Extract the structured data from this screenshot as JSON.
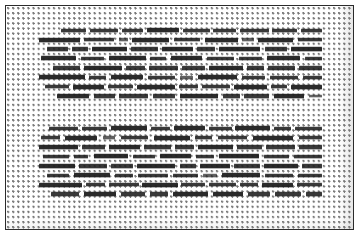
{
  "document": {
    "kind": "scanned-text-page",
    "legible": false,
    "description": "Low-resolution scan of a printed page; body text is unreadable at this resolution and renders as rows of dark dashes over a dot-screen halftone background.",
    "page_background_color": "#ffffff",
    "border_color": "#2b2b2b",
    "dot_grid_color": "#5a5a5a",
    "text_color": "#1e1e1e",
    "dot_pitch_px": 5.1,
    "line_height_px": 9.4,
    "frame": {
      "x": 5,
      "y": 5,
      "width": 349,
      "height": 225
    },
    "text_margin": {
      "left": 33,
      "right": 43,
      "top": 22,
      "bottom": 30
    }
  },
  "paragraphs": [
    {
      "name": "paragraph-1",
      "top": 20,
      "line_count": 8,
      "lines": [
        {
          "indent": 22,
          "words": [
            26,
            4,
            30,
            4,
            22,
            4,
            34,
            4,
            28,
            4,
            24,
            4,
            30,
            4,
            26,
            4,
            22
          ]
        },
        {
          "indent": 0,
          "words": [
            44,
            5,
            32,
            5,
            10,
            5,
            40,
            5,
            28,
            5,
            36,
            5,
            12,
            5,
            38,
            5,
            26
          ]
        },
        {
          "indent": 8,
          "words": [
            20,
            4,
            16,
            4,
            34,
            4,
            26,
            4,
            30,
            4,
            18,
            4,
            40,
            4,
            22,
            4,
            30
          ]
        },
        {
          "indent": 2,
          "words": [
            36,
            5,
            24,
            5,
            38,
            5,
            16,
            5,
            32,
            5,
            28,
            5,
            24,
            5,
            34,
            5,
            18
          ]
        },
        {
          "indent": 14,
          "words": [
            28,
            4,
            40,
            4,
            20,
            4,
            30,
            4,
            24,
            4,
            36,
            4,
            18,
            4,
            28,
            4,
            24
          ]
        },
        {
          "indent": 0,
          "words": [
            48,
            5,
            18,
            5,
            34,
            5,
            28,
            5,
            14,
            5,
            42,
            5,
            24,
            5,
            30,
            5,
            20
          ]
        },
        {
          "indent": 6,
          "words": [
            24,
            4,
            32,
            4,
            26,
            4,
            38,
            4,
            20,
            4,
            28,
            4,
            34,
            4,
            16,
            4,
            32
          ]
        },
        {
          "indent": 18,
          "words": [
            34,
            5,
            22,
            5,
            30,
            5,
            24,
            5,
            40,
            5,
            18,
            5,
            26,
            5,
            32,
            5,
            14
          ]
        }
      ]
    },
    {
      "name": "paragraph-2",
      "top": 118,
      "line_count": 8,
      "lines": [
        {
          "indent": 10,
          "words": [
            30,
            4,
            26,
            4,
            38,
            4,
            20,
            4,
            32,
            4,
            24,
            4,
            36,
            4,
            18,
            4,
            28
          ]
        },
        {
          "indent": 2,
          "words": [
            18,
            5,
            30,
            5,
            12,
            5,
            26,
            5,
            34,
            5,
            16,
            5,
            28,
            5,
            38,
            5,
            22
          ]
        },
        {
          "indent": 0,
          "words": [
            40,
            4,
            24,
            4,
            32,
            4,
            28,
            4,
            20,
            4,
            36,
            4,
            26,
            4,
            30,
            4,
            24
          ]
        },
        {
          "indent": 4,
          "words": [
            26,
            5,
            14,
            5,
            34,
            5,
            22,
            5,
            30,
            5,
            18,
            5,
            40,
            5,
            24,
            5,
            28
          ]
        },
        {
          "indent": 0,
          "words": [
            36,
            4,
            28,
            4,
            22,
            4,
            38,
            4,
            16,
            4,
            30,
            4,
            26,
            4,
            34,
            4,
            20
          ]
        },
        {
          "indent": 8,
          "words": [
            22,
            5,
            36,
            5,
            18,
            5,
            30,
            5,
            26,
            5,
            14,
            5,
            38,
            5,
            28,
            5,
            24
          ]
        },
        {
          "indent": 0,
          "words": [
            44,
            4,
            20,
            4,
            30,
            4,
            36,
            4,
            24,
            4,
            28,
            4,
            18,
            4,
            32,
            4,
            26
          ]
        },
        {
          "indent": 12,
          "words": [
            28,
            5,
            32,
            5,
            24,
            5,
            18,
            5,
            34,
            5,
            30,
            5,
            22,
            5,
            26,
            5,
            16
          ]
        }
      ]
    }
  ]
}
